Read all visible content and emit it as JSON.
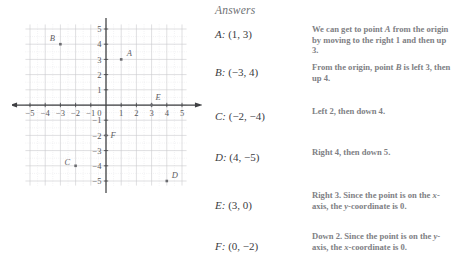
{
  "graph": {
    "x_axis_name": "x",
    "y_axis_name": "y",
    "x_ticks": [
      "−5",
      "−4",
      "−3",
      "−2",
      "−1",
      "0",
      "1",
      "2",
      "3",
      "4",
      "5"
    ],
    "y_ticks_positive": [
      "5",
      "4",
      "3",
      "2",
      "1"
    ],
    "y_ticks_negative": [
      "−1",
      "−2",
      "−3",
      "−4",
      "−5"
    ],
    "origin_label": "0",
    "points": [
      {
        "name": "A",
        "x": 1,
        "y": 3
      },
      {
        "name": "B",
        "x": -3,
        "y": 4
      },
      {
        "name": "C",
        "x": -2,
        "y": -4
      },
      {
        "name": "D",
        "x": 4,
        "y": -5
      },
      {
        "name": "E",
        "x": 3,
        "y": 0
      },
      {
        "name": "F",
        "x": 0,
        "y": -2
      }
    ],
    "axis_color": "#3f4043",
    "grid_color": "#c9cacd",
    "grid_minor_color": "#dedfe2",
    "point_color": "#6b6c70"
  },
  "answers": {
    "heading": "Answers",
    "rows": [
      {
        "label": "A:",
        "value": "(1, 3)",
        "top": 28
      },
      {
        "label": "B:",
        "value": "(−3, 4)",
        "top": 66
      },
      {
        "label": "C:",
        "value": "(−2, −4)",
        "top": 110
      },
      {
        "label": "D:",
        "value": "(4, −5)",
        "top": 151
      },
      {
        "label": "E:",
        "value": "(3, 0)",
        "top": 199
      },
      {
        "label": "F:",
        "value": "(0, −2)",
        "top": 240
      }
    ]
  },
  "explanations": {
    "blocks": [
      {
        "top": 24,
        "html": "We can get to point <i>A</i> from the origin by moving to the right 1 and then up 3."
      },
      {
        "top": 62,
        "html": "From the origin, point <i>B</i> is left 3, then up 4."
      },
      {
        "top": 106,
        "html": "Left 2, then down 4."
      },
      {
        "top": 147,
        "html": "Right 4, then down 5."
      },
      {
        "top": 190,
        "html": "Right 3. Since the point is on the <i>x</i>-axis, the <i>y</i>-coordinate is 0."
      },
      {
        "top": 231,
        "html": "Down 2. Since the point is on the <i>y</i>-axis, the <i>x</i>-coordinate is 0."
      }
    ]
  }
}
